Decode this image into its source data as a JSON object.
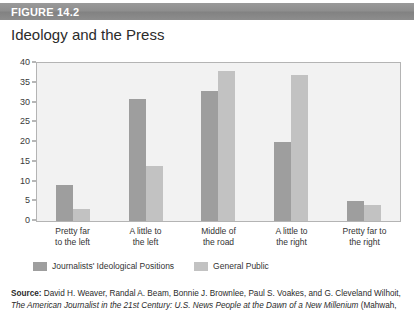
{
  "figure": {
    "header_label": "FIGURE 14.2",
    "title": "Ideology and the Press"
  },
  "source": {
    "label": "Source:",
    "authors": " David H. Weaver, Randal A. Beam, Bonnie J. Brownlee, Paul S. Voakes, and G. Cleveland Wilhoit,",
    "title": "The American Journalist in the 21st Century: U.S. News People at the Dawn of a New Millenium",
    "trailing": " (Mahwah,"
  },
  "colors": {
    "header_bar": "#8e8e8e",
    "series_journalists": "#9e9e9e",
    "series_general_public": "#c2c2c2",
    "plot_background": "#f2f2f2",
    "plot_border": "#b4b4b4"
  },
  "chart_data": {
    "type": "bar",
    "title": "Ideology and the Press",
    "xlabel": "",
    "ylabel": "",
    "ylim": [
      0,
      40
    ],
    "yticks": [
      0,
      5,
      10,
      15,
      20,
      25,
      30,
      35,
      40
    ],
    "grid": false,
    "legend_position": "bottom-left",
    "categories": [
      "Pretty far to the left",
      "A little to the left",
      "Middle of the road",
      "A little to the right",
      "Pretty far to the right"
    ],
    "category_lines": [
      [
        "Pretty far",
        "to the left"
      ],
      [
        "A little to",
        "the left"
      ],
      [
        "Middle of",
        "the road"
      ],
      [
        "A little to",
        "the right"
      ],
      [
        "Pretty far to",
        "the right"
      ]
    ],
    "series": [
      {
        "name": "Journalists' Ideological Positions",
        "color": "#9e9e9e",
        "values": [
          9,
          31,
          33,
          20,
          5
        ]
      },
      {
        "name": "General Public",
        "color": "#c2c2c2",
        "values": [
          3,
          14,
          38,
          37,
          4
        ]
      }
    ]
  }
}
